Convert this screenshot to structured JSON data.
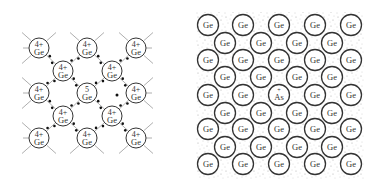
{
  "left_panel": {
    "description": "Covalent bond lattice of germanium with a pentavalent donor impurity",
    "lattice_atom": {
      "charge": "4+",
      "symbol": "Ge"
    },
    "center_atom": {
      "charge": "5",
      "symbol": "Ge"
    },
    "atoms": [
      {
        "x": 39,
        "y": 48,
        "charge": "4+",
        "symbol": "Ge"
      },
      {
        "x": 87,
        "y": 48,
        "charge": "4+",
        "symbol": "Ge"
      },
      {
        "x": 136,
        "y": 48,
        "charge": "4+",
        "symbol": "Ge"
      },
      {
        "x": 63,
        "y": 71,
        "charge": "4+",
        "symbol": "Ge"
      },
      {
        "x": 112,
        "y": 71,
        "charge": "4+",
        "symbol": "Ge"
      },
      {
        "x": 39,
        "y": 93,
        "charge": "4+",
        "symbol": "Ge"
      },
      {
        "x": 87,
        "y": 93,
        "charge": "5",
        "symbol": "Ge"
      },
      {
        "x": 136,
        "y": 93,
        "charge": "4+",
        "symbol": "Ge"
      },
      {
        "x": 63,
        "y": 116,
        "charge": "4+",
        "symbol": "Ge"
      },
      {
        "x": 112,
        "y": 116,
        "charge": "4+",
        "symbol": "Ge"
      },
      {
        "x": 39,
        "y": 138,
        "charge": "4+",
        "symbol": "Ge"
      },
      {
        "x": 87,
        "y": 138,
        "charge": "4+",
        "symbol": "Ge"
      },
      {
        "x": 136,
        "y": 138,
        "charge": "4+",
        "symbol": "Ge"
      }
    ],
    "free_electron": {
      "x": 117,
      "y": 95
    }
  },
  "right_panel": {
    "description": "Germanium lattice with arsenic donor ion in a sea of free electrons",
    "lattice_symbol": "Ge",
    "impurity": {
      "symbol": "As",
      "charge": "+"
    },
    "rows": [
      {
        "y": 25,
        "atoms": [
          "Ge",
          "Ge",
          "Ge",
          "Ge",
          "Ge"
        ]
      },
      {
        "y": 43,
        "atoms": [
          "Ge",
          "Ge",
          "Ge",
          "Ge"
        ]
      },
      {
        "y": 60,
        "atoms": [
          "Ge",
          "Ge",
          "Ge",
          "Ge",
          "Ge"
        ]
      },
      {
        "y": 77,
        "atoms": [
          "Ge",
          "Ge",
          "Ge",
          "Ge"
        ]
      },
      {
        "y": 95,
        "atoms": [
          "Ge",
          "Ge",
          "As",
          "Ge",
          "Ge"
        ]
      },
      {
        "y": 113,
        "atoms": [
          "Ge",
          "Ge",
          "Ge",
          "Ge"
        ]
      },
      {
        "y": 129,
        "atoms": [
          "Ge",
          "Ge",
          "Ge",
          "Ge",
          "Ge"
        ]
      },
      {
        "y": 147,
        "atoms": [
          "Ge",
          "Ge",
          "Ge",
          "Ge"
        ]
      },
      {
        "y": 164,
        "atoms": [
          "Ge",
          "Ge",
          "Ge",
          "Ge",
          "Ge"
        ]
      }
    ],
    "even_row_x": [
      208,
      243,
      279,
      315,
      351
    ],
    "odd_row_x": [
      225,
      261,
      297,
      332
    ]
  },
  "colors": {
    "stroke": "#333333",
    "dot": "#111111",
    "speckle": "#9a9a9a",
    "bond_line": "#999999"
  }
}
